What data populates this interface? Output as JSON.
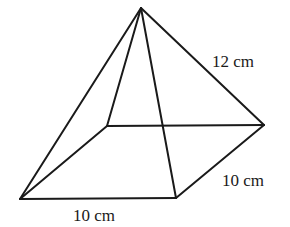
{
  "figure": {
    "type": "square-based pyramid",
    "vertices": {
      "apex": [
        141,
        8
      ],
      "back_left": [
        107,
        126
      ],
      "back_right": [
        264,
        125
      ],
      "front_left": [
        20,
        199
      ],
      "front_right": [
        176,
        198
      ]
    },
    "labels": {
      "slant_edge": "12 cm",
      "base_side_right": "10 cm",
      "base_side_front": "10 cm"
    },
    "stroke_color": "#1a1a1a",
    "background": "#ffffff"
  }
}
